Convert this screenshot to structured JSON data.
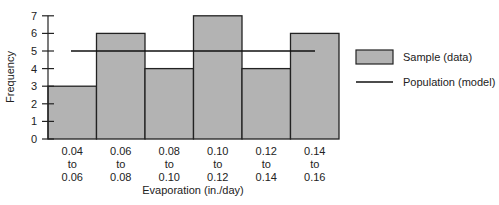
{
  "chart_data": {
    "type": "bar",
    "title": "",
    "xlabel": "Evaporation (in./day)",
    "ylabel": "Frequency",
    "ylim": [
      0,
      7
    ],
    "yticks": [
      0,
      1,
      2,
      3,
      4,
      5,
      6,
      7
    ],
    "categories": [
      [
        "0.04",
        "to",
        "0.06"
      ],
      [
        "0.06",
        "to",
        "0.08"
      ],
      [
        "0.08",
        "to",
        "0.10"
      ],
      [
        "0.10",
        "to",
        "0.12"
      ],
      [
        "0.12",
        "to",
        "0.14"
      ],
      [
        "0.14",
        "to",
        "0.16"
      ]
    ],
    "series": [
      {
        "name": "Sample (data)",
        "kind": "bar",
        "values": [
          3,
          6,
          4,
          7,
          4,
          6
        ],
        "color": "#b3b3b3"
      },
      {
        "name": "Population (model)",
        "kind": "line",
        "values": [
          5,
          5,
          5,
          5,
          5,
          5
        ],
        "color": "#111111"
      }
    ],
    "grid": false,
    "legend_position": "right"
  },
  "legend": {
    "sample_label": "Sample (data)",
    "population_label": "Population (model)"
  },
  "axes": {
    "xlabel": "Evaporation (in./day)",
    "ylabel": "Frequency"
  }
}
